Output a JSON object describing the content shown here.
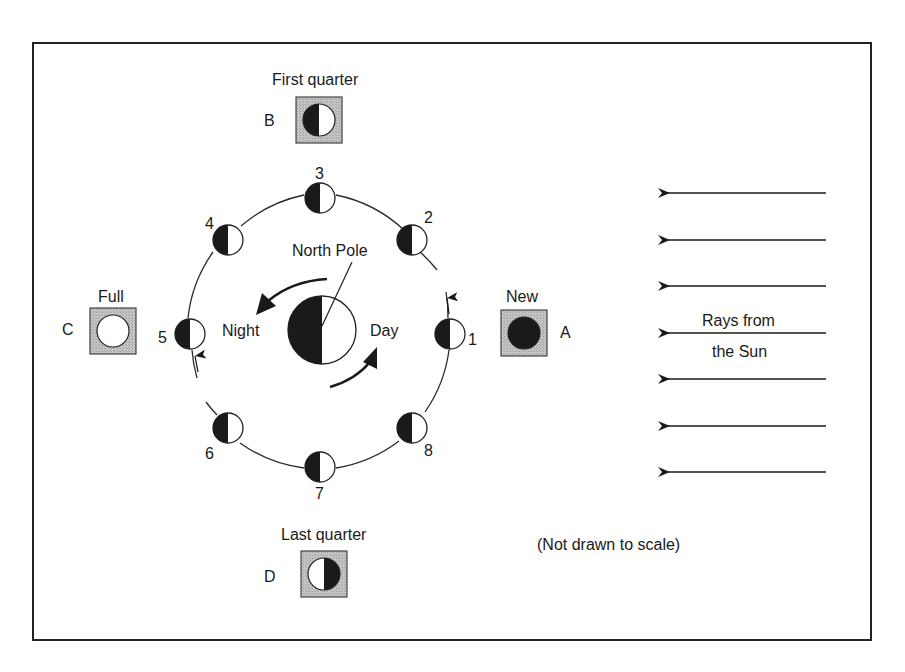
{
  "diagram": {
    "type": "moon-phases",
    "note": "(Not drawn to scale)",
    "colors": {
      "frame": "#222222",
      "dark_side": "#1a1a1a",
      "light_side": "#ffffff",
      "box_fill": "#bdbdbd",
      "stroke": "#222222"
    },
    "earth": {
      "north_pole_label": "North Pole",
      "night_label": "Night",
      "day_label": "Day"
    },
    "sun": {
      "label_line1": "Rays from",
      "label_line2": "the Sun",
      "ray_count": 7
    },
    "orbit_positions": [
      {
        "number": "1",
        "shade": "left-half-dark"
      },
      {
        "number": "2",
        "shade": "left-half-dark"
      },
      {
        "number": "3",
        "shade": "left-half-dark"
      },
      {
        "number": "4",
        "shade": "left-half-dark"
      },
      {
        "number": "5",
        "shade": "left-half-dark"
      },
      {
        "number": "6",
        "shade": "left-half-dark"
      },
      {
        "number": "7",
        "shade": "left-half-dark"
      },
      {
        "number": "8",
        "shade": "left-half-dark"
      }
    ],
    "phase_boxes": [
      {
        "letter": "A",
        "name": "New",
        "appearance": "fully-dark"
      },
      {
        "letter": "B",
        "name": "First quarter",
        "appearance": "left-dark-right-light"
      },
      {
        "letter": "C",
        "name": "Full",
        "appearance": "fully-light"
      },
      {
        "letter": "D",
        "name": "Last quarter",
        "appearance": "left-light-right-dark"
      }
    ]
  }
}
